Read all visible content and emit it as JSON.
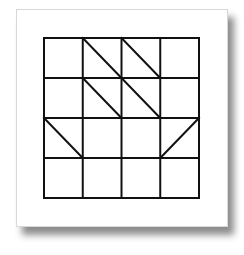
{
  "diagram": {
    "type": "grid-pattern",
    "rows": 4,
    "cols": 4,
    "grid_box": {
      "x": 44,
      "y": 38,
      "width": 155,
      "height": 160
    },
    "stroke_color": "#111111",
    "background_color": "#ffffff",
    "diagonals": [
      {
        "row": 0,
        "col": 1,
        "direction": "tl-br"
      },
      {
        "row": 0,
        "col": 2,
        "direction": "tl-br"
      },
      {
        "row": 1,
        "col": 1,
        "direction": "tl-br"
      },
      {
        "row": 1,
        "col": 2,
        "direction": "tl-br"
      },
      {
        "row": 2,
        "col": 0,
        "direction": "tl-br"
      },
      {
        "row": 2,
        "col": 3,
        "direction": "bl-tr"
      }
    ]
  }
}
